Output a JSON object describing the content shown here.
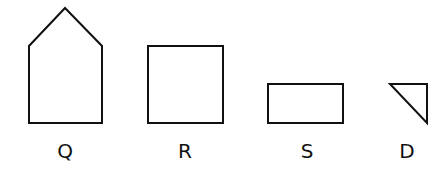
{
  "figures": [
    {
      "label": "Q",
      "shape": "pentagon",
      "points": "29,123 29,46 65,8 102,46 102,123",
      "label_x": 65
    },
    {
      "label": "R",
      "shape": "square",
      "points": "148,46 223,46 223,123 148,123",
      "label_x": 185
    },
    {
      "label": "S",
      "shape": "rectangle",
      "points": "268,84 343,84 343,123 268,123",
      "label_x": 307
    },
    {
      "label": "D",
      "shape": "right-triangle",
      "points": "390,84 427,84 427,123",
      "label_x": 407
    }
  ],
  "stroke_color": "#111111",
  "label_y": 158
}
